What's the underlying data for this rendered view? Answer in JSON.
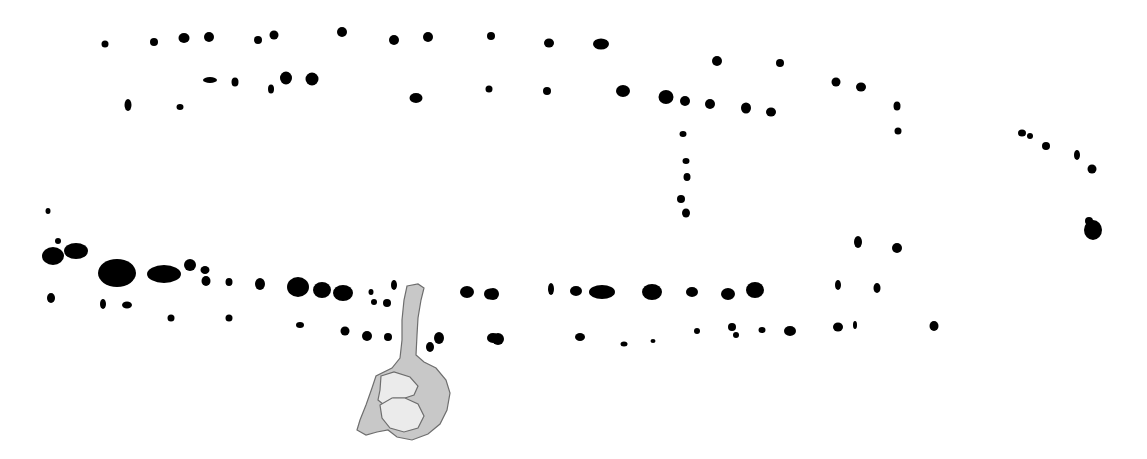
{
  "plan": {
    "width": 1147,
    "height": 459,
    "background": "#ffffff",
    "posthole_color": "#000000",
    "pit_fill": "#c8c8c8",
    "pit_inner_fill": "#ebebeb",
    "pit_stroke": "#6e6e6e",
    "postholes": [
      [
        105,
        44,
        3.5,
        3.5
      ],
      [
        154,
        42,
        4,
        4
      ],
      [
        184,
        38,
        5.5,
        5
      ],
      [
        209,
        37,
        5,
        5
      ],
      [
        258,
        40,
        4,
        4
      ],
      [
        274,
        35,
        4.5,
        4.5
      ],
      [
        342,
        32,
        5,
        5
      ],
      [
        394,
        40,
        5,
        5
      ],
      [
        428,
        37,
        5,
        5
      ],
      [
        491,
        36,
        4,
        4
      ],
      [
        549,
        43,
        5,
        4.5
      ],
      [
        601,
        44,
        8,
        5.5
      ],
      [
        210,
        80,
        7,
        3
      ],
      [
        235,
        82,
        3.5,
        4.5
      ],
      [
        271,
        89,
        3,
        4.5
      ],
      [
        286,
        78,
        6,
        6.5
      ],
      [
        312,
        79,
        6.5,
        6.5
      ],
      [
        128,
        105,
        3.5,
        6
      ],
      [
        180,
        107,
        3.5,
        3
      ],
      [
        416,
        98,
        6.5,
        5
      ],
      [
        489,
        89,
        3.5,
        3.5
      ],
      [
        547,
        91,
        4,
        4
      ],
      [
        623,
        91,
        7,
        6
      ],
      [
        666,
        97,
        7.5,
        7
      ],
      [
        685,
        101,
        5,
        5
      ],
      [
        710,
        104,
        5,
        5
      ],
      [
        746,
        108,
        5,
        5.5
      ],
      [
        771,
        112,
        5,
        4.5
      ],
      [
        717,
        61,
        5,
        5
      ],
      [
        780,
        63,
        4,
        4
      ],
      [
        836,
        82,
        4.5,
        4.5
      ],
      [
        861,
        87,
        5,
        4.5
      ],
      [
        897,
        106,
        3.5,
        4.5
      ],
      [
        898,
        131,
        3.5,
        3.5
      ],
      [
        683,
        134,
        3.5,
        3
      ],
      [
        686,
        161,
        3.5,
        3
      ],
      [
        687,
        177,
        3.5,
        4
      ],
      [
        681,
        199,
        4,
        4
      ],
      [
        686,
        213,
        4,
        4.5
      ],
      [
        1022,
        133,
        4,
        3.5
      ],
      [
        1030,
        136,
        3,
        3
      ],
      [
        1046,
        146,
        4,
        4
      ],
      [
        1077,
        155,
        3,
        5
      ],
      [
        1092,
        169,
        4.5,
        4.5
      ],
      [
        1093,
        230,
        9,
        10
      ],
      [
        1089,
        221,
        4,
        4
      ],
      [
        48,
        211,
        2.5,
        3
      ],
      [
        58,
        241,
        3,
        3
      ],
      [
        53,
        256,
        11,
        9
      ],
      [
        76,
        251,
        12,
        8
      ],
      [
        117,
        273,
        19,
        14
      ],
      [
        164,
        274,
        17,
        9
      ],
      [
        190,
        265,
        6,
        6
      ],
      [
        205,
        270,
        4.5,
        4
      ],
      [
        206,
        281,
        4.5,
        5
      ],
      [
        229,
        282,
        3.5,
        4
      ],
      [
        260,
        284,
        5,
        6
      ],
      [
        298,
        287,
        11,
        10
      ],
      [
        322,
        290,
        9,
        8
      ],
      [
        343,
        293,
        10,
        8
      ],
      [
        51,
        298,
        4,
        5
      ],
      [
        103,
        304,
        3,
        5
      ],
      [
        127,
        305,
        5,
        3.5
      ],
      [
        171,
        318,
        3.5,
        3.5
      ],
      [
        229,
        318,
        3.5,
        3.5
      ],
      [
        300,
        325,
        4,
        3
      ],
      [
        345,
        331,
        4.5,
        4.5
      ],
      [
        367,
        336,
        5,
        5
      ],
      [
        388,
        337,
        4,
        4
      ],
      [
        371,
        292,
        2.5,
        3
      ],
      [
        374,
        302,
        3,
        3
      ],
      [
        394,
        285,
        3,
        5
      ],
      [
        387,
        303,
        4,
        4
      ],
      [
        467,
        292,
        7,
        6
      ],
      [
        490,
        294,
        6,
        5.5
      ],
      [
        493,
        338,
        6,
        5
      ],
      [
        439,
        338,
        5,
        6
      ],
      [
        430,
        347,
        4,
        5
      ],
      [
        493,
        294,
        6,
        6
      ],
      [
        551,
        289,
        3,
        6
      ],
      [
        576,
        291,
        6,
        5
      ],
      [
        602,
        292,
        13,
        7
      ],
      [
        652,
        292,
        10,
        8
      ],
      [
        692,
        292,
        6,
        5
      ],
      [
        728,
        294,
        7,
        6
      ],
      [
        755,
        290,
        9,
        8
      ],
      [
        838,
        285,
        3,
        5
      ],
      [
        877,
        288,
        3.5,
        5
      ],
      [
        498,
        339,
        6,
        6
      ],
      [
        580,
        337,
        5,
        4
      ],
      [
        624,
        344,
        3.5,
        2.5
      ],
      [
        653,
        341,
        2.5,
        2
      ],
      [
        697,
        331,
        3,
        3
      ],
      [
        732,
        327,
        4,
        4
      ],
      [
        736,
        335,
        3,
        3
      ],
      [
        762,
        330,
        3.5,
        3
      ],
      [
        790,
        331,
        6,
        5
      ],
      [
        838,
        327,
        5,
        4.5
      ],
      [
        855,
        325,
        2,
        4
      ],
      [
        934,
        326,
        4.5,
        5
      ],
      [
        858,
        242,
        4,
        6
      ],
      [
        897,
        248,
        5,
        5
      ]
    ],
    "pit": {
      "outline": "M407,286 L418,284 L424,288 L421,300 L418,318 L417,335 L416,355 L424,362 L436,368 L446,380 L450,393 L447,410 L440,424 L428,434 L412,440 L397,437 L388,430 L377,432 L366,435 L357,430 L360,420 L366,405 L372,388 L376,376 L392,368 L400,358 L402,340 L402,320 L404,300 Z",
      "inner_upper": "M381,376 L394,372 L410,377 L418,386 L414,395 L405,398 L393,398 L384,405 L378,400 L380,390 Z",
      "inner_lower": "M380,405 L392,398 L405,398 L418,404 L424,416 L418,428 L404,432 L390,428 L382,418 Z"
    }
  }
}
